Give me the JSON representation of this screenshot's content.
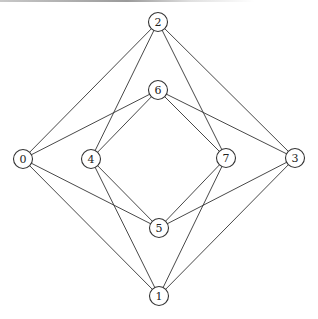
{
  "graph": {
    "title": "",
    "node_radius": 9.5,
    "nodes": [
      {
        "id": "0",
        "label": "0",
        "x": 23,
        "y": 159
      },
      {
        "id": "1",
        "label": "1",
        "x": 159,
        "y": 296
      },
      {
        "id": "2",
        "label": "2",
        "x": 158,
        "y": 22
      },
      {
        "id": "3",
        "label": "3",
        "x": 295,
        "y": 158
      },
      {
        "id": "4",
        "label": "4",
        "x": 91,
        "y": 159
      },
      {
        "id": "5",
        "label": "5",
        "x": 159,
        "y": 228
      },
      {
        "id": "6",
        "label": "6",
        "x": 158,
        "y": 90
      },
      {
        "id": "7",
        "label": "7",
        "x": 226,
        "y": 158
      }
    ],
    "edges": [
      [
        "2",
        "0"
      ],
      [
        "2",
        "4"
      ],
      [
        "2",
        "7"
      ],
      [
        "2",
        "3"
      ],
      [
        "6",
        "0"
      ],
      [
        "6",
        "4"
      ],
      [
        "6",
        "7"
      ],
      [
        "6",
        "3"
      ],
      [
        "5",
        "0"
      ],
      [
        "5",
        "4"
      ],
      [
        "5",
        "7"
      ],
      [
        "5",
        "3"
      ],
      [
        "1",
        "0"
      ],
      [
        "1",
        "4"
      ],
      [
        "1",
        "7"
      ],
      [
        "1",
        "3"
      ]
    ]
  }
}
